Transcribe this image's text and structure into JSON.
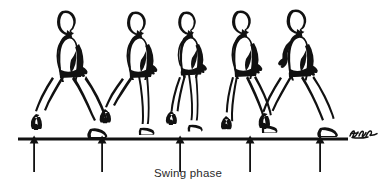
{
  "figure": {
    "caption": "Swing phase",
    "ground_line": {
      "label": "ground-line",
      "x_start": 18,
      "x_end": 348,
      "y": 139,
      "color": "#111111",
      "thickness": 3
    },
    "signature": {
      "present": true,
      "label": "artist-signature",
      "x": 350,
      "y": 133
    },
    "ink_color": "#111111",
    "background_color": "#ffffff",
    "walk_direction": "left-to-right",
    "figures": [
      {
        "index": 1,
        "label": "gait-figure-1",
        "phase": "terminal-stance / toe-off",
        "head_center_x": 65,
        "head_center_y": 21,
        "scale": 1.0,
        "stride": "wide",
        "front_leg": "extended-forward",
        "rear_leg": "extended-back-heel-raised"
      },
      {
        "index": 2,
        "label": "gait-figure-2",
        "phase": "initial-swing",
        "head_center_x": 135,
        "head_center_y": 22,
        "scale": 0.96,
        "stride": "medium",
        "front_leg": "vertical-support",
        "rear_leg": "lifting-back"
      },
      {
        "index": 3,
        "label": "gait-figure-3",
        "phase": "mid-swing",
        "head_center_x": 186,
        "head_center_y": 22,
        "scale": 0.93,
        "stride": "narrow",
        "front_leg": "vertical-support",
        "rear_leg": "passing-adjacent"
      },
      {
        "index": 4,
        "label": "gait-figure-4",
        "phase": "terminal-swing",
        "head_center_x": 240,
        "head_center_y": 21,
        "scale": 0.96,
        "stride": "medium",
        "front_leg": "reaching-forward",
        "rear_leg": "trailing"
      },
      {
        "index": 5,
        "label": "gait-figure-5",
        "phase": "initial-contact / heel-strike",
        "head_center_x": 296,
        "head_center_y": 20,
        "scale": 1.02,
        "stride": "wide",
        "front_leg": "extended-forward-heel-strike",
        "rear_leg": "extended-back"
      }
    ],
    "arrows": [
      {
        "index": 1,
        "label": "event-arrow-1",
        "x": 34,
        "tip_y": 136,
        "tail_y": 172
      },
      {
        "index": 2,
        "label": "event-arrow-2",
        "x": 102,
        "tip_y": 136,
        "tail_y": 172
      },
      {
        "index": 3,
        "label": "event-arrow-3",
        "x": 180,
        "tip_y": 136,
        "tail_y": 172
      },
      {
        "index": 4,
        "label": "event-arrow-4",
        "x": 250,
        "tip_y": 136,
        "tail_y": 172
      },
      {
        "index": 5,
        "label": "event-arrow-5",
        "x": 320,
        "tip_y": 136,
        "tail_y": 172
      }
    ]
  }
}
